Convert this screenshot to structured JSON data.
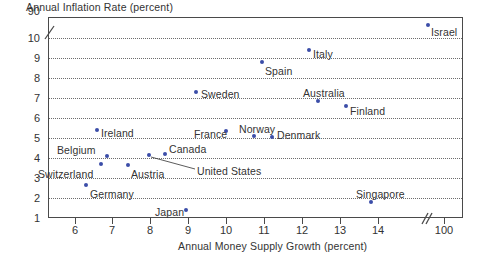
{
  "chart_data": {
    "type": "scatter",
    "title": "",
    "ylabel": "Annual Inflation Rate (percent)",
    "xlabel": "Annual Money Supply Growth (percent)",
    "x_ticks": [
      "6",
      "7",
      "8",
      "9",
      "10",
      "11",
      "12",
      "13",
      "14",
      "100"
    ],
    "y_ticks": [
      "90",
      "10",
      "9",
      "8",
      "7",
      "6",
      "5",
      "4",
      "3",
      "2",
      "1"
    ],
    "x_axis_break": true,
    "y_axis_break": true,
    "grid": true,
    "legend": "none",
    "point_color": "#3b4da8",
    "points": [
      {
        "label": "Germany",
        "x": 6.4,
        "y": 2.8,
        "label_pos": "below-right"
      },
      {
        "label": "Switzerland",
        "x": 6.75,
        "y": 3.8,
        "label_pos": "left"
      },
      {
        "label": "Belgium",
        "x": 7.0,
        "y": 4.25,
        "label_pos": "left"
      },
      {
        "label": "Ireland",
        "x": 6.8,
        "y": 5.85,
        "label_pos": "right"
      },
      {
        "label": "Austria",
        "x": 7.4,
        "y": 3.6,
        "label_pos": "below-right"
      },
      {
        "label": "United States",
        "x": 8.0,
        "y": 4.25,
        "label_pos": "leader-right"
      },
      {
        "label": "Canada",
        "x": 8.4,
        "y": 4.35,
        "label_pos": "right"
      },
      {
        "label": "Japan",
        "x": 8.95,
        "y": 1.6,
        "label_pos": "left"
      },
      {
        "label": "Sweden",
        "x": 9.55,
        "y": 7.5,
        "label_pos": "right"
      },
      {
        "label": "France",
        "x": 9.95,
        "y": 5.6,
        "label_pos": "left"
      },
      {
        "label": "Norway",
        "x": 10.6,
        "y": 5.35,
        "label_pos": "above"
      },
      {
        "label": "Spain",
        "x": 10.8,
        "y": 8.9,
        "label_pos": "below-right"
      },
      {
        "label": "Denmark",
        "x": 11.05,
        "y": 5.3,
        "label_pos": "right"
      },
      {
        "label": "Italy",
        "x": 12.1,
        "y": 9.5,
        "label_pos": "right"
      },
      {
        "label": "Australia",
        "x": 12.3,
        "y": 7.05,
        "label_pos": "above"
      },
      {
        "label": "Finland",
        "x": 12.9,
        "y": 6.6,
        "label_pos": "right"
      },
      {
        "label": "Singapore",
        "x": 13.5,
        "y": 2.1,
        "label_pos": "above"
      },
      {
        "label": "Israel",
        "x": 100,
        "y": 90,
        "label_pos": "below-right"
      }
    ]
  },
  "axes": {
    "y_title": "Annual Inflation Rate (percent)",
    "x_title": "Annual Money Supply Growth (percent)",
    "y_labels": [
      {
        "text": "90",
        "top": 5
      },
      {
        "text": "10",
        "top": 32
      },
      {
        "text": "9",
        "top": 52
      },
      {
        "text": "8",
        "top": 72
      },
      {
        "text": "7",
        "top": 92
      },
      {
        "text": "6",
        "top": 112
      },
      {
        "text": "5",
        "top": 132
      },
      {
        "text": "4",
        "top": 152
      },
      {
        "text": "3",
        "top": 172
      },
      {
        "text": "2",
        "top": 192
      },
      {
        "text": "1",
        "top": 212
      }
    ],
    "gridlines_top": [
      38,
      58,
      78,
      98,
      118,
      138,
      158,
      178,
      198
    ],
    "x_labels": [
      {
        "text": "6",
        "left": 75
      },
      {
        "text": "7",
        "left": 112
      },
      {
        "text": "8",
        "left": 150
      },
      {
        "text": "9",
        "left": 188
      },
      {
        "text": "10",
        "left": 226
      },
      {
        "text": "11",
        "left": 264
      },
      {
        "text": "12",
        "left": 302
      },
      {
        "text": "13",
        "left": 340
      },
      {
        "text": "14",
        "left": 378
      },
      {
        "text": "100",
        "left": 444
      }
    ]
  },
  "marks": [
    {
      "name": "germany",
      "label": "Germany",
      "px": 86,
      "py": 185,
      "lx": 90,
      "ly": 188
    },
    {
      "name": "switzerland",
      "label": "Switzerland",
      "px": 101,
      "py": 164,
      "lx": 38,
      "ly": 168
    },
    {
      "name": "belgium",
      "label": "Belgium",
      "px": 107,
      "py": 156,
      "lx": 57,
      "ly": 144
    },
    {
      "name": "ireland",
      "label": "Ireland",
      "px": 97,
      "py": 130,
      "lx": 101,
      "ly": 127
    },
    {
      "name": "austria",
      "label": "Austria",
      "px": 128,
      "py": 165,
      "lx": 131,
      "ly": 168
    },
    {
      "name": "united-states",
      "label": "United States",
      "px": 149,
      "py": 155,
      "lx": 197,
      "ly": 165
    },
    {
      "name": "canada",
      "label": "Canada",
      "px": 165,
      "py": 154,
      "lx": 169,
      "ly": 143
    },
    {
      "name": "japan",
      "label": "Japan",
      "px": 186,
      "py": 210,
      "lx": 155,
      "ly": 206
    },
    {
      "name": "sweden",
      "label": "Sweden",
      "px": 196,
      "py": 92,
      "lx": 201,
      "ly": 88
    },
    {
      "name": "france",
      "label": "France",
      "px": 226,
      "py": 131,
      "lx": 194,
      "ly": 128
    },
    {
      "name": "norway",
      "label": "Norway",
      "px": 254,
      "py": 136,
      "lx": 239,
      "ly": 123
    },
    {
      "name": "spain",
      "label": "Spain",
      "px": 262,
      "py": 62,
      "lx": 265,
      "ly": 65
    },
    {
      "name": "denmark",
      "label": "Denmark",
      "px": 272,
      "py": 137,
      "lx": 277,
      "ly": 129
    },
    {
      "name": "italy",
      "label": "Italy",
      "px": 309,
      "py": 50,
      "lx": 313,
      "ly": 48
    },
    {
      "name": "australia",
      "label": "Australia",
      "px": 318,
      "py": 101,
      "lx": 303,
      "ly": 87
    },
    {
      "name": "finland",
      "label": "Finland",
      "px": 346,
      "py": 106,
      "lx": 350,
      "ly": 105
    },
    {
      "name": "singapore",
      "label": "Singapore",
      "px": 371,
      "py": 202,
      "lx": 356,
      "ly": 188
    },
    {
      "name": "israel",
      "label": "Israel",
      "px": 428,
      "py": 25,
      "lx": 431,
      "ly": 26
    }
  ]
}
